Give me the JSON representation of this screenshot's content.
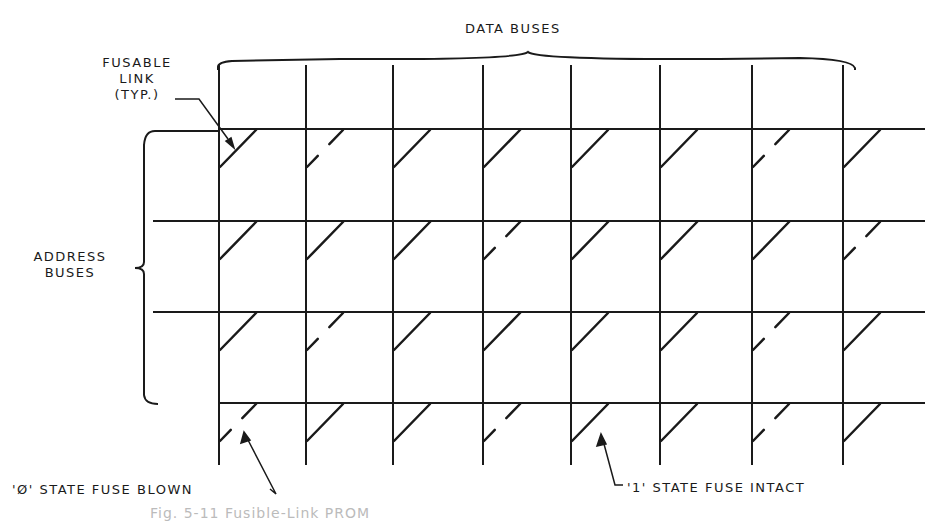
{
  "labels": {
    "data_buses": "DATA BUSES",
    "fusable_link": [
      "FUSABLE",
      "LINK",
      "(TYP.)"
    ],
    "address_buses": [
      "ADDRESS",
      "BUSES"
    ],
    "zero_state": "'Ø' STATE FUSE BLOWN",
    "one_state": "'1' STATE FUSE INTACT",
    "caption": "Fig. 5-11 Fusible-Link PROM"
  },
  "colors": {
    "ink": "#1a1a1a",
    "background": "#ffffff"
  },
  "grid": {
    "columns_x": [
      219,
      306,
      393,
      483,
      571,
      660,
      752,
      843
    ],
    "rows_y": [
      129,
      221,
      312,
      403
    ],
    "row_x_start": 153,
    "row_x_end": 925,
    "col_y_top": 65,
    "col_y_bottom": 465,
    "fuse_states": [
      [
        1,
        0,
        1,
        1,
        1,
        1,
        0,
        1
      ],
      [
        1,
        1,
        1,
        0,
        1,
        1,
        1,
        0
      ],
      [
        1,
        0,
        1,
        1,
        1,
        1,
        0,
        1
      ],
      [
        0,
        1,
        1,
        0,
        1,
        1,
        0,
        1
      ]
    ]
  }
}
